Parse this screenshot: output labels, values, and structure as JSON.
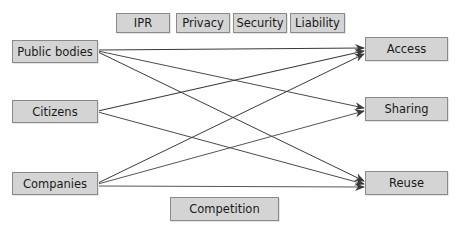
{
  "diagram": {
    "top_factors": [
      {
        "id": "ipr",
        "label": "IPR"
      },
      {
        "id": "privacy",
        "label": "Privacy"
      },
      {
        "id": "security",
        "label": "Security"
      },
      {
        "id": "liability",
        "label": "Liability"
      }
    ],
    "bottom_factor": {
      "id": "competition",
      "label": "Competition"
    },
    "actors": [
      {
        "id": "public-bodies",
        "label": "Public bodies"
      },
      {
        "id": "citizens",
        "label": "Citizens"
      },
      {
        "id": "companies",
        "label": "Companies"
      }
    ],
    "activities": [
      {
        "id": "access",
        "label": "Access"
      },
      {
        "id": "sharing",
        "label": "Sharing"
      },
      {
        "id": "reuse",
        "label": "Reuse"
      }
    ],
    "edges": [
      {
        "from": "Public bodies",
        "to": "Access"
      },
      {
        "from": "Public bodies",
        "to": "Sharing"
      },
      {
        "from": "Public bodies",
        "to": "Reuse"
      },
      {
        "from": "Citizens",
        "to": "Access"
      },
      {
        "from": "Citizens",
        "to": "Reuse"
      },
      {
        "from": "Companies",
        "to": "Access"
      },
      {
        "from": "Companies",
        "to": "Sharing"
      },
      {
        "from": "Companies",
        "to": "Reuse"
      }
    ],
    "colors": {
      "box_fill": "#d4d4d4",
      "box_border": "#8a8a8a",
      "arrow": "#3a3a3a"
    }
  }
}
